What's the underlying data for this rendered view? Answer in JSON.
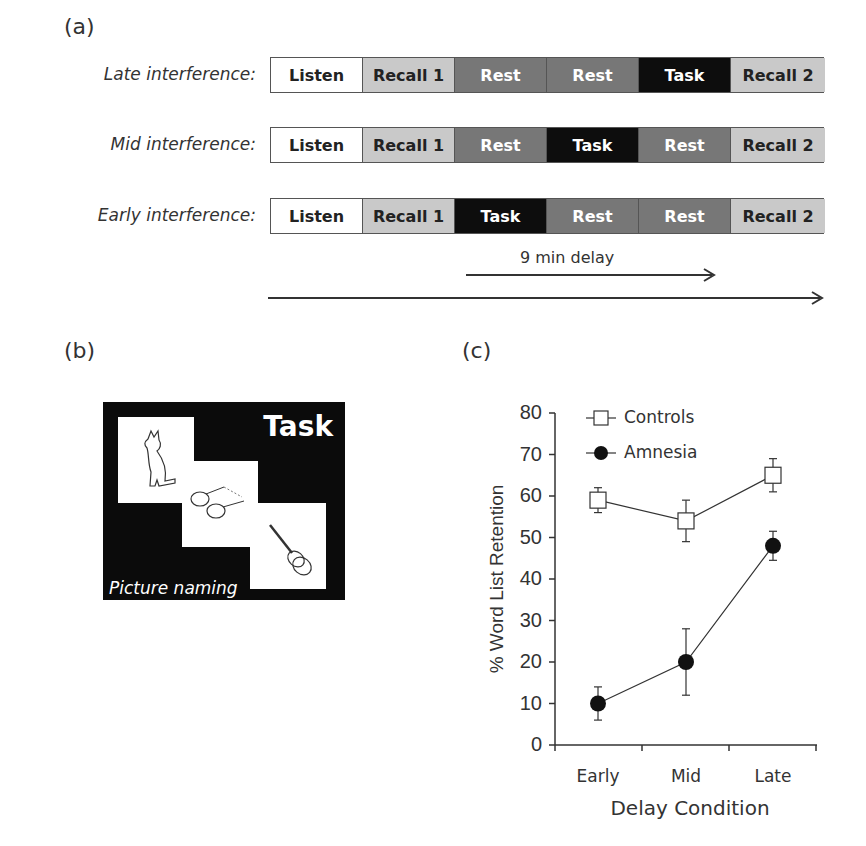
{
  "panel_a": {
    "label": "(a)",
    "rows": [
      {
        "label": "Late interference:",
        "segments": [
          {
            "text": "Listen",
            "type": "listen"
          },
          {
            "text": "Recall 1",
            "type": "recall"
          },
          {
            "text": "Rest",
            "type": "rest"
          },
          {
            "text": "Rest",
            "type": "rest"
          },
          {
            "text": "Task",
            "type": "task"
          },
          {
            "text": "Recall 2",
            "type": "recall"
          }
        ]
      },
      {
        "label": "Mid interference:",
        "segments": [
          {
            "text": "Listen",
            "type": "listen"
          },
          {
            "text": "Recall 1",
            "type": "recall"
          },
          {
            "text": "Rest",
            "type": "rest"
          },
          {
            "text": "Task",
            "type": "task"
          },
          {
            "text": "Rest",
            "type": "rest"
          },
          {
            "text": "Recall 2",
            "type": "recall"
          }
        ]
      },
      {
        "label": "Early interference:",
        "segments": [
          {
            "text": "Listen",
            "type": "listen"
          },
          {
            "text": "Recall 1",
            "type": "recall"
          },
          {
            "text": "Task",
            "type": "task"
          },
          {
            "text": "Rest",
            "type": "rest"
          },
          {
            "text": "Rest",
            "type": "rest"
          },
          {
            "text": "Recall 2",
            "type": "recall"
          }
        ]
      }
    ],
    "delay_label": "9 min delay"
  },
  "panel_b": {
    "label": "(b)",
    "title": "Task",
    "caption": "Picture naming",
    "pictures": [
      "cat",
      "glasses",
      "guitar"
    ]
  },
  "panel_c": {
    "label": "(c)"
  },
  "chart_data": {
    "type": "line",
    "title": "",
    "xlabel": "Delay Condition",
    "ylabel": "% Word List Retention",
    "categories": [
      "Early",
      "Mid",
      "Late"
    ],
    "ylim": [
      0,
      80
    ],
    "yticks": [
      0,
      10,
      20,
      30,
      40,
      50,
      60,
      70,
      80
    ],
    "grid": false,
    "legend_position": "top-left",
    "series": [
      {
        "name": "Controls",
        "marker": "open-square",
        "values": [
          59,
          54,
          65
        ],
        "error": [
          3,
          5,
          4
        ]
      },
      {
        "name": "Amnesia",
        "marker": "filled-circle",
        "values": [
          10,
          20,
          48
        ],
        "error": [
          4,
          8,
          3.5
        ]
      }
    ]
  }
}
